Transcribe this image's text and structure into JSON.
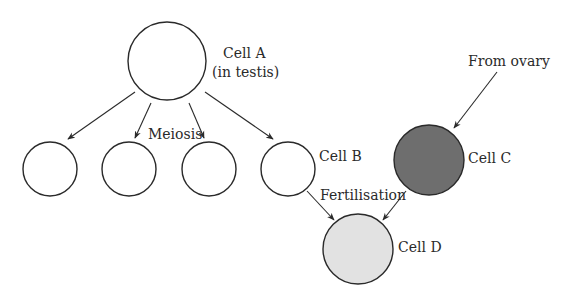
{
  "diagram": {
    "type": "cell-division-fertilisation",
    "colors": {
      "stroke": "#2a2a2a",
      "cell_default_fill": "#ffffff",
      "cell_c_fill": "#6e6e6e",
      "cell_d_fill": "#e2e2e2"
    },
    "cells": [
      {
        "id": "A",
        "label": "Cell A",
        "sublabel": "(in testis)"
      },
      {
        "id": "B",
        "label": "Cell B"
      },
      {
        "id": "C",
        "label": "Cell C"
      },
      {
        "id": "D",
        "label": "Cell D"
      }
    ],
    "process_labels": {
      "meiosis": "Meiosis",
      "fertilisation": "Fertilisation",
      "from_ovary": "From ovary"
    },
    "edges": [
      {
        "from": "Cell A",
        "to": "gamete-1",
        "label": "Meiosis"
      },
      {
        "from": "Cell A",
        "to": "gamete-2",
        "label": "Meiosis"
      },
      {
        "from": "Cell A",
        "to": "gamete-3",
        "label": "Meiosis"
      },
      {
        "from": "Cell A",
        "to": "Cell B",
        "label": "Meiosis"
      },
      {
        "from": "ovary",
        "to": "Cell C",
        "label": "From ovary"
      },
      {
        "from": "Cell B",
        "to": "Cell D",
        "label": "Fertilisation"
      },
      {
        "from": "Cell C",
        "to": "Cell D",
        "label": "Fertilisation"
      }
    ]
  }
}
